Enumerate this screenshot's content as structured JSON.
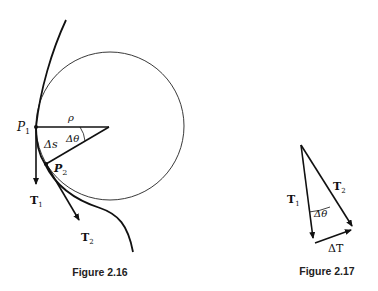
{
  "figure_16": {
    "caption": "Figure 2.16",
    "labels": {
      "p1": "P",
      "p1_sub": "1",
      "p2": "P",
      "p2_sub": "2",
      "rho": "ρ",
      "dtheta": "Δθ",
      "ds": "Δs",
      "t1": "T",
      "t1_sub": "1",
      "t2": "T",
      "t2_sub": "2"
    }
  },
  "figure_17": {
    "caption": "Figure 2.17",
    "labels": {
      "t1": "T",
      "t1_sub": "1",
      "t2": "T",
      "t2_sub": "2",
      "dtheta": "Δθ",
      "dT": "ΔT"
    }
  },
  "colors": {
    "ink": "#111111",
    "background": "#ffffff"
  }
}
